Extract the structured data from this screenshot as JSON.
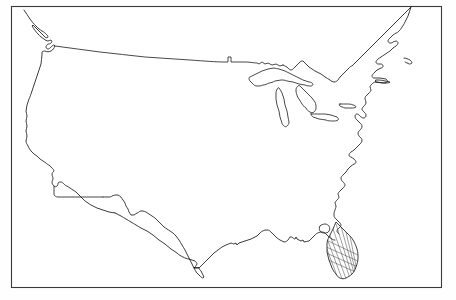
{
  "figure": {
    "alt_text": "Blank black and white outline map of the lower 48 United States inside a thin rectangular border, with the Florida peninsula filled with diagonal hatching",
    "map_type": "outline-map",
    "region": "Contiguous United States (Lower 48)",
    "projection_note": "conic",
    "has_labels": false,
    "has_state_boundaries": false,
    "background_color": "#ffffff",
    "line_color": "#1a1a1a",
    "frame_color": "#3a3a3a"
  },
  "frame": {
    "x": 11,
    "y": 6,
    "width": 431,
    "height": 282,
    "stroke_width": 1.1
  },
  "features": [
    {
      "id": "national-outline",
      "name": "United States national outline",
      "interactable": false
    },
    {
      "id": "canadian-border",
      "name": "Northern border with Canada (49th parallel)",
      "interactable": false
    },
    {
      "id": "great-lakes",
      "name": "Great Lakes",
      "members": [
        "Lake Superior",
        "Lake Michigan",
        "Lake Huron",
        "Lake Erie",
        "Lake Ontario"
      ],
      "interactable": false
    },
    {
      "id": "florida-hatched",
      "name": "Florida peninsula (hatched / highlighted)",
      "shading": "diagonal-hatch",
      "interactable": false
    }
  ],
  "legend": {
    "visible": false,
    "entries": []
  },
  "annotations": [],
  "caption": ""
}
